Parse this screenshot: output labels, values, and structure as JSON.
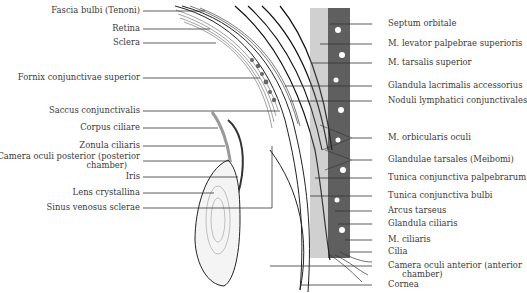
{
  "diagram": {
    "left_labels": [
      {
        "text": "Fascia bulbi (Tenoni)",
        "y": 11
      },
      {
        "text": "Retina",
        "y": 29
      },
      {
        "text": "Sclera",
        "y": 43
      },
      {
        "text": "Fornix conjunctivae superior",
        "y": 78
      },
      {
        "text": "Saccus conjunctivalis",
        "y": 111
      },
      {
        "text": "Corpus ciliare",
        "y": 128
      },
      {
        "text": "Zonula ciliaris",
        "y": 146
      },
      {
        "text": "Camera oculi posterior (posterior",
        "y": 157
      },
      {
        "text": "chamber)",
        "y": 166
      },
      {
        "text": "Iris",
        "y": 177
      },
      {
        "text": "Lens crystallina",
        "y": 193
      },
      {
        "text": "Sinus venosus sclerae",
        "y": 208
      }
    ],
    "right_labels": [
      {
        "text": "Septum orbitale",
        "y": 24
      },
      {
        "text": "M. levator palpebrae superioris",
        "y": 44
      },
      {
        "text": "M. tarsalis superior",
        "y": 63
      },
      {
        "text": "Glandula lacrimalis accessorius",
        "y": 86
      },
      {
        "text": "Noduli lymphatici conjunctivales",
        "y": 101
      },
      {
        "text": "M. orbicularis oculi",
        "y": 138
      },
      {
        "text": "Glandulae tarsales (Meibomi)",
        "y": 160
      },
      {
        "text": "Tunica conjunctiva palpebrarum",
        "y": 178
      },
      {
        "text": "Tunica conjunctiva bulbi",
        "y": 196
      },
      {
        "text": "Arcus tarseus",
        "y": 211
      },
      {
        "text": "Glandula ciliaris",
        "y": 224
      },
      {
        "text": "M. ciliaris",
        "y": 240
      },
      {
        "text": "Cilia",
        "y": 252
      },
      {
        "text": "Camera oculi anterior (anterior",
        "y": 266
      },
      {
        "text": "chamber)",
        "y": 275
      },
      {
        "text": "Cornea",
        "y": 285
      }
    ]
  }
}
